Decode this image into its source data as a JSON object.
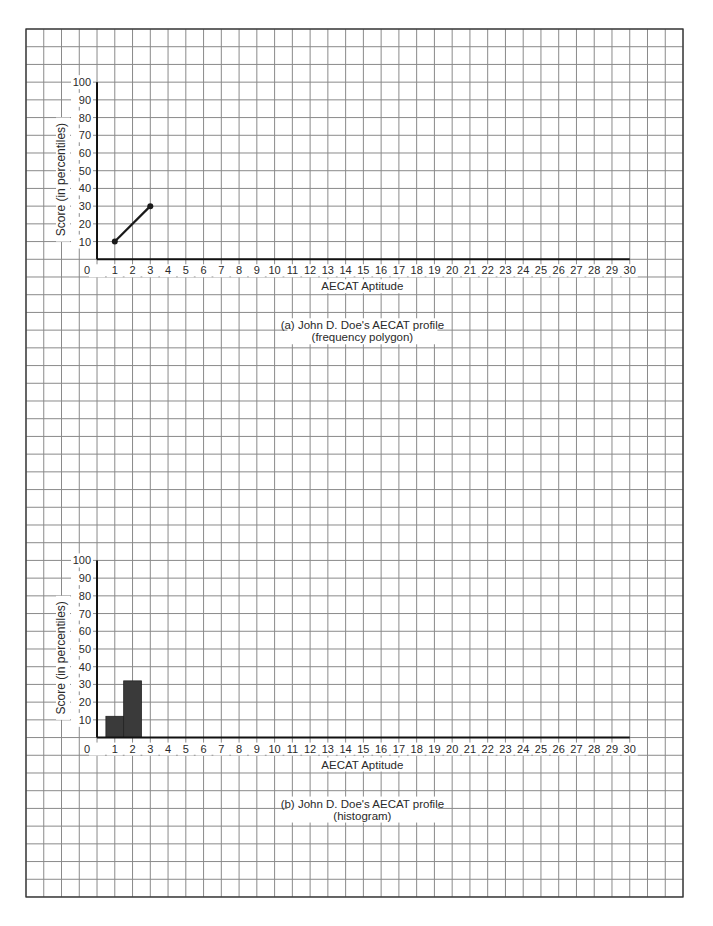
{
  "page": {
    "background": "#ffffff",
    "grid": {
      "color": "#8a8a8a",
      "border_color": "#333333",
      "cols": 37,
      "rows": 49
    }
  },
  "chart_data": [
    {
      "type": "line",
      "title": "(a) John D. Doe's AECAT profile",
      "subtitle": "(frequency polygon)",
      "xlabel": "AECAT Aptitude",
      "ylabel": "Score (in percentiles)",
      "xlim": [
        0,
        30
      ],
      "ylim": [
        0,
        100
      ],
      "x_ticks": [
        0,
        1,
        2,
        3,
        4,
        5,
        6,
        7,
        8,
        9,
        10,
        11,
        12,
        13,
        14,
        15,
        16,
        17,
        18,
        19,
        20,
        21,
        22,
        23,
        24,
        25,
        26,
        27,
        28,
        29,
        30
      ],
      "y_ticks": [
        10,
        20,
        30,
        40,
        50,
        60,
        70,
        80,
        90,
        100
      ],
      "grid": true,
      "series": [
        {
          "name": "John D. Doe",
          "x": [
            1,
            3
          ],
          "y": [
            10,
            30
          ],
          "color": "#1a1a1a",
          "markers": true
        }
      ]
    },
    {
      "type": "bar",
      "title": "(b) John D. Doe's AECAT profile",
      "subtitle": "(histogram)",
      "xlabel": "AECAT Aptitude",
      "ylabel": "Score (in percentiles)",
      "xlim": [
        0,
        30
      ],
      "ylim": [
        0,
        100
      ],
      "x_ticks": [
        0,
        1,
        2,
        3,
        4,
        5,
        6,
        7,
        8,
        9,
        10,
        11,
        12,
        13,
        14,
        15,
        16,
        17,
        18,
        19,
        20,
        21,
        22,
        23,
        24,
        25,
        26,
        27,
        28,
        29,
        30
      ],
      "y_ticks": [
        10,
        20,
        30,
        40,
        50,
        60,
        70,
        80,
        90,
        100
      ],
      "grid": true,
      "categories": [
        1,
        2
      ],
      "values": [
        12,
        32
      ],
      "bar_width": 1,
      "color": "#3a3a3a"
    }
  ]
}
